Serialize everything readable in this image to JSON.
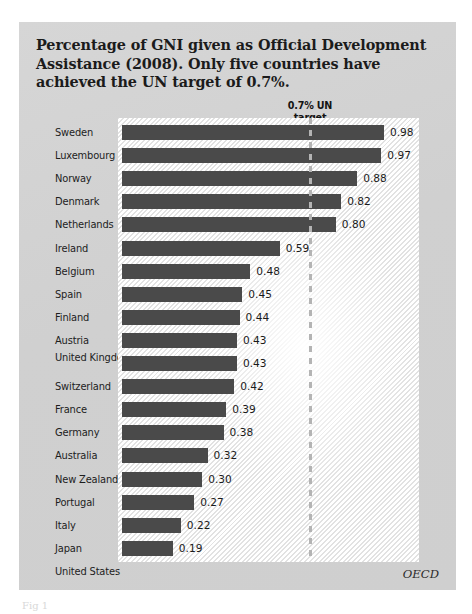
{
  "figure": {
    "title": "Percentage of GNI given as Official Development Assistance (2008). Only five countries have achieved the UN target of 0.7%.",
    "source": "OECD",
    "caption": "Fig 1",
    "target_label_line1": "0.7% UN",
    "target_label_line2": "target",
    "panel_color": "#d3d3d3",
    "bar_color": "#4a4a4a",
    "target_line_color": "#b4b4b4",
    "plot_background": "#ffffff"
  },
  "chart_data": {
    "type": "bar",
    "orientation": "horizontal",
    "title": "Percentage of GNI given as Official Development Assistance (2008). Only five countries have achieved the UN target of 0.7%.",
    "xlabel": "",
    "ylabel": "",
    "xlim": [
      0,
      1.04
    ],
    "grid": false,
    "legend": false,
    "annotations": [
      {
        "text": "0.7% UN target",
        "type": "vertical-reference-line",
        "value": 0.7
      }
    ],
    "source": "OECD",
    "categories": [
      "Sweden",
      "Luxembourg",
      "Norway",
      "Denmark",
      "Netherlands",
      "Ireland",
      "Belgium",
      "Spain",
      "Finland",
      "Austria",
      "United Kingdom",
      "Switzerland",
      "France",
      "Germany",
      "Australia",
      "New Zealand",
      "Portugal",
      "Italy",
      "Japan",
      "United States"
    ],
    "values": [
      0.98,
      0.97,
      0.88,
      0.82,
      0.8,
      0.59,
      0.48,
      0.45,
      0.44,
      0.43,
      0.43,
      0.42,
      0.39,
      0.38,
      0.32,
      0.3,
      0.27,
      0.22,
      0.19,
      0.19
    ],
    "value_labels": [
      "0.98",
      "0.97",
      "0.88",
      "0.82",
      "0.80",
      "0.59",
      "0.48",
      "0.45",
      "0.44",
      "0.43",
      "0.43",
      "0.42",
      "0.39",
      "0.38",
      "0.32",
      "0.30",
      "0.27",
      "0.22",
      "0.19",
      "0.19"
    ]
  }
}
